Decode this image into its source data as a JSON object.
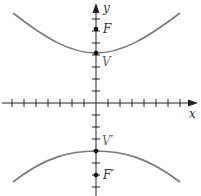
{
  "diagram": {
    "type": "hyperbola",
    "axes": {
      "x_label": "x",
      "y_label": "y"
    },
    "points": {
      "focus_top": "F",
      "vertex_top": "V",
      "vertex_bottom": "V′",
      "focus_bottom": "F′"
    },
    "colors": {
      "curve": "#7a7a7a",
      "axis": "#222222",
      "point": "#111111"
    }
  }
}
